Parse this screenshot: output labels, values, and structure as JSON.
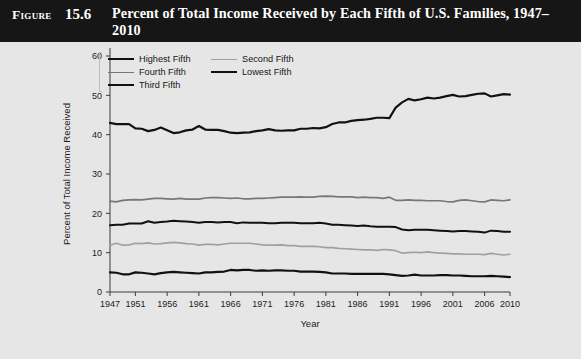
{
  "figure": {
    "label": "Figure",
    "number": "15.6",
    "title": "Percent of Total Income Received by Each Fifth of U.S. Families, 1947–2010"
  },
  "legend": {
    "position": "top-left-inside",
    "entries": [
      {
        "label": "Highest Fifth",
        "color": "#111111",
        "width": 2.2
      },
      {
        "label": "Second Fifth",
        "color": "#a0a0a0",
        "width": 1.7
      },
      {
        "label": "Fourth Fifth",
        "color": "#777777",
        "width": 1.7
      },
      {
        "label": "Lowest Fifth",
        "color": "#111111",
        "width": 2.2
      },
      {
        "label": "Third Fifth",
        "color": "#111111",
        "width": 2.2
      }
    ]
  },
  "chart_data": {
    "type": "line",
    "title": "Percent of Total Income Received by Each Fifth of U.S. Families, 1947–2010",
    "xlabel": "Year",
    "ylabel": "Percent of Total Income Received",
    "xlim": [
      1947,
      2010
    ],
    "ylim": [
      0,
      60
    ],
    "yticks": [
      0,
      10,
      20,
      30,
      40,
      50,
      60
    ],
    "xticks": [
      1947,
      1951,
      1956,
      1961,
      1966,
      1971,
      1976,
      1981,
      1986,
      1991,
      1996,
      2001,
      2006,
      2010
    ],
    "grid": false,
    "legend_position": "upper left",
    "x": [
      1947,
      1948,
      1949,
      1950,
      1951,
      1952,
      1953,
      1954,
      1955,
      1956,
      1957,
      1958,
      1959,
      1960,
      1961,
      1962,
      1963,
      1964,
      1965,
      1966,
      1967,
      1968,
      1969,
      1970,
      1971,
      1972,
      1973,
      1974,
      1975,
      1976,
      1977,
      1978,
      1979,
      1980,
      1981,
      1982,
      1983,
      1984,
      1985,
      1986,
      1987,
      1988,
      1989,
      1990,
      1991,
      1992,
      1993,
      1994,
      1995,
      1996,
      1997,
      1998,
      1999,
      2000,
      2001,
      2002,
      2003,
      2004,
      2005,
      2006,
      2007,
      2008,
      2009,
      2010
    ],
    "series": [
      {
        "name": "Highest Fifth",
        "color": "#111111",
        "width": 2.2,
        "values": [
          43.0,
          42.7,
          42.7,
          42.7,
          41.6,
          41.5,
          40.9,
          41.2,
          41.8,
          41.1,
          40.4,
          40.6,
          41.1,
          41.3,
          42.2,
          41.3,
          41.2,
          41.2,
          40.9,
          40.5,
          40.4,
          40.5,
          40.6,
          40.9,
          41.1,
          41.4,
          41.1,
          41.0,
          41.1,
          41.1,
          41.5,
          41.5,
          41.7,
          41.6,
          41.9,
          42.7,
          43.1,
          43.1,
          43.5,
          43.7,
          43.8,
          44.0,
          44.3,
          44.3,
          44.2,
          46.9,
          48.2,
          49.1,
          48.7,
          49.0,
          49.4,
          49.2,
          49.4,
          49.8,
          50.1,
          49.7,
          49.8,
          50.1,
          50.4,
          50.5,
          49.7,
          50.0,
          50.3,
          50.2
        ]
      },
      {
        "name": "Fourth Fifth",
        "color": "#777777",
        "width": 1.7,
        "values": [
          23.1,
          22.9,
          23.3,
          23.4,
          23.5,
          23.4,
          23.6,
          23.8,
          23.8,
          23.7,
          23.6,
          23.8,
          23.6,
          23.6,
          23.6,
          23.9,
          24.0,
          24.0,
          23.9,
          23.8,
          23.9,
          23.7,
          23.7,
          23.8,
          23.8,
          23.9,
          24.0,
          24.1,
          24.1,
          24.1,
          24.2,
          24.1,
          24.1,
          24.3,
          24.4,
          24.3,
          24.2,
          24.2,
          24.2,
          24.0,
          24.1,
          24.0,
          24.0,
          23.8,
          24.1,
          23.3,
          23.3,
          23.4,
          23.3,
          23.3,
          23.2,
          23.2,
          23.2,
          23.0,
          22.9,
          23.3,
          23.4,
          23.2,
          23.0,
          22.9,
          23.4,
          23.3,
          23.2,
          23.4
        ]
      },
      {
        "name": "Third Fifth",
        "color": "#111111",
        "width": 2.0,
        "values": [
          17.0,
          17.1,
          17.1,
          17.4,
          17.4,
          17.4,
          18.0,
          17.6,
          17.8,
          17.9,
          18.1,
          18.0,
          17.9,
          17.8,
          17.6,
          17.8,
          17.8,
          17.7,
          17.8,
          17.8,
          17.5,
          17.7,
          17.6,
          17.6,
          17.6,
          17.5,
          17.5,
          17.6,
          17.6,
          17.6,
          17.5,
          17.5,
          17.5,
          17.6,
          17.4,
          17.1,
          17.1,
          17.0,
          16.9,
          16.8,
          16.9,
          16.7,
          16.6,
          16.6,
          16.6,
          16.5,
          15.9,
          15.7,
          15.8,
          15.8,
          15.8,
          15.7,
          15.6,
          15.5,
          15.4,
          15.5,
          15.5,
          15.4,
          15.3,
          15.1,
          15.6,
          15.5,
          15.3,
          15.3
        ]
      },
      {
        "name": "Second Fifth",
        "color": "#a0a0a0",
        "width": 1.7,
        "values": [
          11.9,
          12.4,
          11.9,
          12.0,
          12.4,
          12.3,
          12.5,
          12.2,
          12.3,
          12.5,
          12.6,
          12.5,
          12.3,
          12.2,
          11.9,
          12.1,
          12.1,
          12.0,
          12.2,
          12.4,
          12.4,
          12.4,
          12.4,
          12.2,
          12.0,
          11.9,
          11.9,
          12.0,
          11.8,
          11.8,
          11.6,
          11.6,
          11.6,
          11.5,
          11.3,
          11.3,
          11.1,
          11.0,
          10.9,
          10.8,
          10.7,
          10.7,
          10.6,
          10.8,
          10.7,
          10.5,
          9.9,
          10.0,
          10.1,
          10.0,
          10.2,
          10.0,
          9.9,
          9.8,
          9.7,
          9.7,
          9.6,
          9.6,
          9.6,
          9.5,
          9.8,
          9.6,
          9.4,
          9.6
        ]
      },
      {
        "name": "Lowest Fifth",
        "color": "#111111",
        "width": 2.2,
        "values": [
          5.0,
          4.9,
          4.5,
          4.5,
          5.0,
          4.9,
          4.7,
          4.5,
          4.8,
          5.0,
          5.1,
          5.0,
          4.9,
          4.8,
          4.7,
          5.0,
          5.0,
          5.1,
          5.2,
          5.6,
          5.5,
          5.6,
          5.6,
          5.4,
          5.5,
          5.4,
          5.5,
          5.5,
          5.4,
          5.4,
          5.2,
          5.2,
          5.2,
          5.1,
          5.0,
          4.7,
          4.7,
          4.7,
          4.6,
          4.6,
          4.6,
          4.6,
          4.6,
          4.6,
          4.5,
          4.3,
          4.1,
          4.2,
          4.4,
          4.2,
          4.2,
          4.2,
          4.3,
          4.3,
          4.2,
          4.2,
          4.1,
          4.0,
          4.0,
          4.0,
          4.1,
          4.0,
          3.9,
          3.8
        ]
      }
    ]
  }
}
